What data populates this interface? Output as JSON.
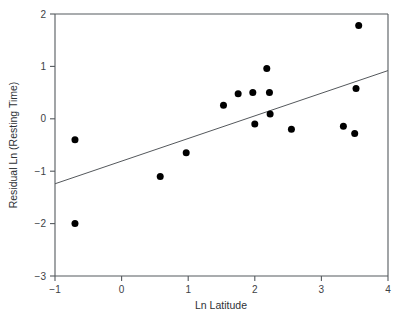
{
  "chart_data": {
    "type": "scatter",
    "title": "",
    "subtitle": "",
    "xlabel": "Ln Latitude",
    "ylabel": "Residual Ln (Resting Time)",
    "xlim": [
      -1,
      4
    ],
    "ylim": [
      -3,
      2
    ],
    "xticks": [
      -1,
      0,
      1,
      2,
      3,
      4
    ],
    "yticks": [
      -3,
      -2,
      -1,
      0,
      1,
      2
    ],
    "xtick_labels": [
      "−1",
      "0",
      "1",
      "2",
      "3",
      "4"
    ],
    "ytick_labels": [
      "−3",
      "−2",
      "−1",
      "0",
      "1",
      "2"
    ],
    "grid": false,
    "legend": false,
    "legend_position": "none",
    "marker": "filled-circle",
    "marker_color": "#000000",
    "marker_size_px": 7,
    "point_count": 16,
    "points": [
      {
        "x": -0.7,
        "y": -0.4
      },
      {
        "x": -0.7,
        "y": -2.0
      },
      {
        "x": 0.58,
        "y": -1.1
      },
      {
        "x": 0.97,
        "y": -0.65
      },
      {
        "x": 1.53,
        "y": 0.26
      },
      {
        "x": 1.75,
        "y": 0.48
      },
      {
        "x": 1.97,
        "y": 0.5
      },
      {
        "x": 2.0,
        "y": -0.1
      },
      {
        "x": 2.18,
        "y": 0.96
      },
      {
        "x": 2.22,
        "y": 0.5
      },
      {
        "x": 2.23,
        "y": 0.09
      },
      {
        "x": 2.55,
        "y": -0.2
      },
      {
        "x": 3.33,
        "y": -0.14
      },
      {
        "x": 3.5,
        "y": -0.28
      },
      {
        "x": 3.52,
        "y": 0.58
      },
      {
        "x": 3.56,
        "y": 1.78
      }
    ],
    "trendline": {
      "type": "linear-fit",
      "x_start": -1,
      "y_start": -1.24,
      "x_end": 4,
      "y_end": 0.92,
      "slope": 0.432,
      "intercept": -0.808,
      "color": "#54585c"
    },
    "axis_color": "#555a5e",
    "background_color": "#ffffff"
  }
}
